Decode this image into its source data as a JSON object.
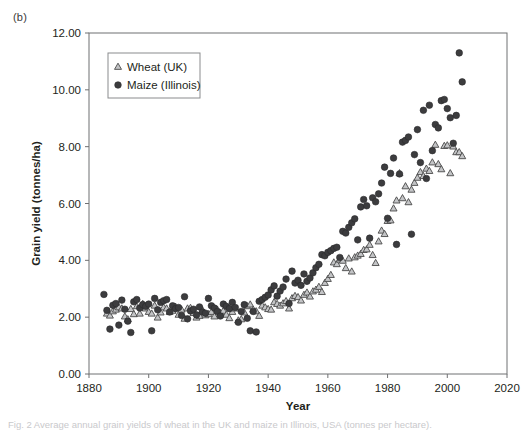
{
  "panel": {
    "label": "(b)"
  },
  "caption": {
    "text": "Fig. 2 Average annual grain yields of wheat in the UK and maize in Illinois, USA (tonnes per hectare)."
  },
  "chart_data": {
    "type": "scatter",
    "title": "",
    "xlabel": "Year",
    "ylabel": "Grain yield (tonnes/ha)",
    "xlim": [
      1880,
      2020
    ],
    "ylim": [
      0.0,
      12.0
    ],
    "xticks": [
      1880,
      1900,
      1920,
      1940,
      1960,
      1980,
      2000,
      2020
    ],
    "xtick_labels": [
      "1880",
      "1900",
      "1920",
      "1940",
      "1960",
      "1980",
      "2000",
      "2020"
    ],
    "yticks": [
      0.0,
      2.0,
      4.0,
      6.0,
      8.0,
      10.0,
      12.0
    ],
    "ytick_labels": [
      "0.00",
      "2.00",
      "4.00",
      "6.00",
      "8.00",
      "10.00",
      "12.00"
    ],
    "grid": false,
    "legend_position": "upper-left-inside",
    "series": [
      {
        "name": "Wheat (UK)",
        "marker": "triangle",
        "fill": "#c3c4c6",
        "edge": "#4a4a4a",
        "points": [
          [
            1886,
            2.12
          ],
          [
            1887,
            2.05
          ],
          [
            1888,
            2.2
          ],
          [
            1889,
            2.26
          ],
          [
            1890,
            2.34
          ],
          [
            1891,
            2.3
          ],
          [
            1892,
            2.02
          ],
          [
            1893,
            1.92
          ],
          [
            1894,
            2.28
          ],
          [
            1895,
            2.1
          ],
          [
            1896,
            2.38
          ],
          [
            1897,
            2.12
          ],
          [
            1898,
            2.46
          ],
          [
            1899,
            2.3
          ],
          [
            1900,
            2.18
          ],
          [
            1901,
            2.12
          ],
          [
            1902,
            2.4
          ],
          [
            1903,
            1.98
          ],
          [
            1904,
            2.16
          ],
          [
            1905,
            2.34
          ],
          [
            1906,
            2.3
          ],
          [
            1907,
            2.18
          ],
          [
            1908,
            2.22
          ],
          [
            1909,
            2.36
          ],
          [
            1910,
            2.08
          ],
          [
            1911,
            2.26
          ],
          [
            1912,
            1.94
          ],
          [
            1913,
            2.3
          ],
          [
            1914,
            2.32
          ],
          [
            1915,
            2.14
          ],
          [
            1916,
            1.98
          ],
          [
            1917,
            2.04
          ],
          [
            1918,
            2.24
          ],
          [
            1919,
            2.06
          ],
          [
            1920,
            2.1
          ],
          [
            1921,
            2.18
          ],
          [
            1922,
            2.02
          ],
          [
            1923,
            2.26
          ],
          [
            1924,
            2.14
          ],
          [
            1925,
            2.22
          ],
          [
            1926,
            2.08
          ],
          [
            1927,
            1.96
          ],
          [
            1928,
            2.18
          ],
          [
            1929,
            2.3
          ],
          [
            1930,
            1.88
          ],
          [
            1931,
            1.92
          ],
          [
            1932,
            2.16
          ],
          [
            1933,
            2.38
          ],
          [
            1934,
            2.44
          ],
          [
            1935,
            2.26
          ],
          [
            1936,
            2.2
          ],
          [
            1937,
            2.04
          ],
          [
            1938,
            2.4
          ],
          [
            1939,
            2.34
          ],
          [
            1940,
            2.28
          ],
          [
            1941,
            2.26
          ],
          [
            1942,
            2.52
          ],
          [
            1943,
            2.46
          ],
          [
            1944,
            2.4
          ],
          [
            1945,
            2.48
          ],
          [
            1946,
            2.56
          ],
          [
            1947,
            2.3
          ],
          [
            1948,
            2.66
          ],
          [
            1949,
            2.74
          ],
          [
            1950,
            2.7
          ],
          [
            1951,
            2.58
          ],
          [
            1952,
            2.78
          ],
          [
            1953,
            2.86
          ],
          [
            1954,
            2.72
          ],
          [
            1955,
            2.9
          ],
          [
            1956,
            2.96
          ],
          [
            1957,
            3.06
          ],
          [
            1958,
            2.88
          ],
          [
            1959,
            3.2
          ],
          [
            1960,
            3.34
          ],
          [
            1961,
            3.48
          ],
          [
            1962,
            3.92
          ],
          [
            1963,
            3.86
          ],
          [
            1964,
            4.02
          ],
          [
            1965,
            3.98
          ],
          [
            1966,
            3.72
          ],
          [
            1967,
            4.06
          ],
          [
            1968,
            3.6
          ],
          [
            1969,
            4.1
          ],
          [
            1970,
            4.16
          ],
          [
            1971,
            4.22
          ],
          [
            1972,
            4.36
          ],
          [
            1973,
            4.38
          ],
          [
            1974,
            4.54
          ],
          [
            1975,
            4.18
          ],
          [
            1976,
            3.9
          ],
          [
            1977,
            4.66
          ],
          [
            1978,
            5.04
          ],
          [
            1979,
            4.92
          ],
          [
            1980,
            5.38
          ],
          [
            1981,
            5.4
          ],
          [
            1982,
            5.82
          ],
          [
            1983,
            6.1
          ],
          [
            1984,
            7.06
          ],
          [
            1985,
            6.18
          ],
          [
            1986,
            6.6
          ],
          [
            1987,
            6.04
          ],
          [
            1988,
            6.48
          ],
          [
            1989,
            6.72
          ],
          [
            1990,
            6.9
          ],
          [
            1991,
            7.1
          ],
          [
            1992,
            6.96
          ],
          [
            1993,
            7.22
          ],
          [
            1994,
            7.14
          ],
          [
            1995,
            7.44
          ],
          [
            1996,
            8.06
          ],
          [
            1997,
            7.38
          ],
          [
            1998,
            7.2
          ],
          [
            1999,
            8.02
          ],
          [
            2000,
            8.04
          ],
          [
            2001,
            7.06
          ],
          [
            2002,
            8.0
          ],
          [
            2003,
            7.8
          ],
          [
            2004,
            7.8
          ],
          [
            2005,
            7.66
          ]
        ]
      },
      {
        "name": "Maize (Illinois)",
        "marker": "circle",
        "fill": "#3c3c3e",
        "edge": "#2a2a2c",
        "points": [
          [
            1885,
            2.8
          ],
          [
            1886,
            2.24
          ],
          [
            1887,
            1.58
          ],
          [
            1888,
            2.42
          ],
          [
            1889,
            2.48
          ],
          [
            1890,
            1.72
          ],
          [
            1891,
            2.6
          ],
          [
            1892,
            2.28
          ],
          [
            1893,
            1.86
          ],
          [
            1894,
            1.46
          ],
          [
            1895,
            2.54
          ],
          [
            1896,
            2.62
          ],
          [
            1897,
            2.32
          ],
          [
            1898,
            2.44
          ],
          [
            1899,
            2.38
          ],
          [
            1900,
            2.46
          ],
          [
            1901,
            1.52
          ],
          [
            1902,
            2.66
          ],
          [
            1903,
            2.26
          ],
          [
            1904,
            2.52
          ],
          [
            1905,
            2.58
          ],
          [
            1906,
            2.62
          ],
          [
            1907,
            2.18
          ],
          [
            1908,
            2.4
          ],
          [
            1909,
            2.3
          ],
          [
            1910,
            2.34
          ],
          [
            1911,
            2.06
          ],
          [
            1912,
            2.72
          ],
          [
            1913,
            1.94
          ],
          [
            1914,
            2.22
          ],
          [
            1915,
            2.28
          ],
          [
            1916,
            2.08
          ],
          [
            1917,
            2.36
          ],
          [
            1918,
            2.18
          ],
          [
            1919,
            2.14
          ],
          [
            1920,
            2.66
          ],
          [
            1921,
            2.4
          ],
          [
            1922,
            2.32
          ],
          [
            1923,
            2.2
          ],
          [
            1924,
            2.04
          ],
          [
            1925,
            2.46
          ],
          [
            1926,
            2.38
          ],
          [
            1927,
            2.3
          ],
          [
            1928,
            2.52
          ],
          [
            1929,
            2.34
          ],
          [
            1930,
            1.82
          ],
          [
            1931,
            2.2
          ],
          [
            1932,
            2.44
          ],
          [
            1933,
            1.96
          ],
          [
            1934,
            1.52
          ],
          [
            1935,
            2.2
          ],
          [
            1936,
            1.48
          ],
          [
            1937,
            2.56
          ],
          [
            1938,
            2.62
          ],
          [
            1939,
            2.7
          ],
          [
            1940,
            2.78
          ],
          [
            1941,
            2.96
          ],
          [
            1942,
            3.1
          ],
          [
            1943,
            2.74
          ],
          [
            1944,
            2.92
          ],
          [
            1945,
            3.06
          ],
          [
            1946,
            3.34
          ],
          [
            1947,
            2.48
          ],
          [
            1948,
            3.62
          ],
          [
            1949,
            3.2
          ],
          [
            1950,
            3.3
          ],
          [
            1951,
            3.12
          ],
          [
            1952,
            3.52
          ],
          [
            1953,
            3.26
          ],
          [
            1954,
            3.38
          ],
          [
            1955,
            3.56
          ],
          [
            1956,
            3.74
          ],
          [
            1957,
            3.86
          ],
          [
            1958,
            4.2
          ],
          [
            1959,
            4.16
          ],
          [
            1960,
            4.28
          ],
          [
            1961,
            4.34
          ],
          [
            1962,
            4.42
          ],
          [
            1963,
            4.46
          ],
          [
            1964,
            4.1
          ],
          [
            1965,
            5.02
          ],
          [
            1966,
            4.96
          ],
          [
            1967,
            5.16
          ],
          [
            1968,
            5.32
          ],
          [
            1969,
            5.46
          ],
          [
            1970,
            4.72
          ],
          [
            1971,
            5.88
          ],
          [
            1972,
            6.14
          ],
          [
            1973,
            5.92
          ],
          [
            1974,
            4.78
          ],
          [
            1975,
            6.2
          ],
          [
            1976,
            6.06
          ],
          [
            1977,
            6.34
          ],
          [
            1978,
            6.72
          ],
          [
            1979,
            7.28
          ],
          [
            1980,
            5.48
          ],
          [
            1981,
            7.06
          ],
          [
            1982,
            7.6
          ],
          [
            1983,
            4.56
          ],
          [
            1984,
            7.04
          ],
          [
            1985,
            8.16
          ],
          [
            1986,
            8.22
          ],
          [
            1987,
            8.34
          ],
          [
            1988,
            4.92
          ],
          [
            1989,
            7.72
          ],
          [
            1990,
            8.6
          ],
          [
            1991,
            7.44
          ],
          [
            1992,
            9.28
          ],
          [
            1993,
            6.88
          ],
          [
            1994,
            9.46
          ],
          [
            1995,
            7.86
          ],
          [
            1996,
            8.78
          ],
          [
            1997,
            8.66
          ],
          [
            1998,
            9.62
          ],
          [
            1999,
            9.66
          ],
          [
            2000,
            9.34
          ],
          [
            2001,
            9.02
          ],
          [
            2002,
            8.12
          ],
          [
            2003,
            9.1
          ],
          [
            2004,
            11.3
          ],
          [
            2005,
            10.28
          ]
        ]
      }
    ]
  }
}
